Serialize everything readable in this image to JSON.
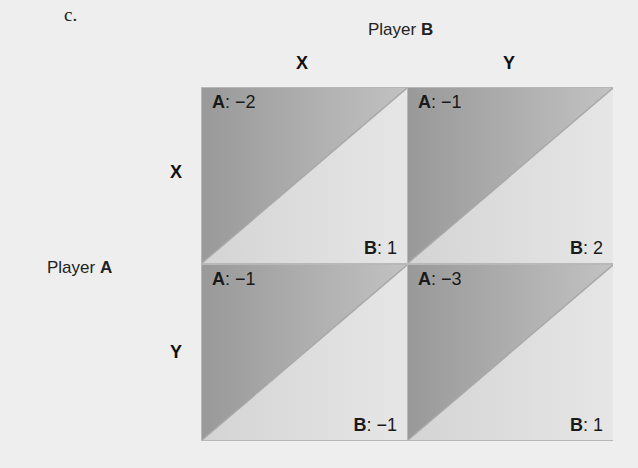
{
  "part_label": "c.",
  "player_b": {
    "prefix": "Player ",
    "name": "B"
  },
  "player_a": {
    "prefix": "Player ",
    "name": "A"
  },
  "columns": [
    "X",
    "Y"
  ],
  "rows": [
    "X",
    "Y"
  ],
  "cells": [
    {
      "row": "X",
      "col": "X",
      "a_label": "A",
      "a_value": ": −2",
      "b_label": "B",
      "b_value": ": 1"
    },
    {
      "row": "X",
      "col": "Y",
      "a_label": "A",
      "a_value": ": −1",
      "b_label": "B",
      "b_value": ": 2"
    },
    {
      "row": "Y",
      "col": "X",
      "a_label": "A",
      "a_value": ": −1",
      "b_label": "B",
      "b_value": ": −1"
    },
    {
      "row": "Y",
      "col": "Y",
      "a_label": "A",
      "a_value": ": −3",
      "b_label": "B",
      "b_value": ": 1"
    }
  ],
  "colors": {
    "background": "#eeeeee",
    "upper_triangle_dark": "#999999",
    "upper_triangle_light": "#c2c2c2",
    "lower_triangle_dark": "#d4d4d4",
    "lower_triangle_light": "#e6e6e6",
    "divider": "#a8a8a8"
  }
}
